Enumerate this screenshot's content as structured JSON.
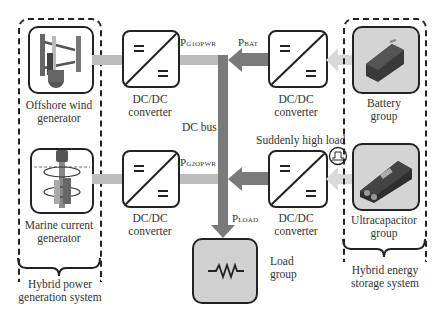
{
  "diagram": {
    "left_group": {
      "title": "Hybrid power generation system",
      "title_line1": "Hybrid power",
      "title_line2": "generation system",
      "items": [
        {
          "id": "wind",
          "label_line1": "Offshore wind",
          "label_line2": "generator",
          "icon": "vertical-axis-wind-turbine-icon"
        },
        {
          "id": "marine",
          "label_line1": "Marine current",
          "label_line2": "generator",
          "icon": "marine-current-turbine-icon"
        }
      ]
    },
    "right_group": {
      "title": "Hybrid energy storage system",
      "title_line1": "Hybrid energy",
      "title_line2": "storage system",
      "items": [
        {
          "id": "battery",
          "label_line1": "Battery",
          "label_line2": "group",
          "icon": "battery-pack-icon"
        },
        {
          "id": "ultracap",
          "label_line1": "Ultracapacitor",
          "label_line2": "group",
          "icon": "ultracapacitor-module-icon"
        }
      ]
    },
    "converters": [
      {
        "id": "conv-g1",
        "label_line1": "DC/DC",
        "label_line2": "converter"
      },
      {
        "id": "conv-g2",
        "label_line1": "DC/DC",
        "label_line2": "converter"
      },
      {
        "id": "conv-bat",
        "label_line1": "DC/DC",
        "label_line2": "converter"
      },
      {
        "id": "conv-uc",
        "label_line1": "DC/DC",
        "label_line2": "converter"
      }
    ],
    "converter_symbol": "=",
    "bus": {
      "label": "DC bus"
    },
    "flows": {
      "g1": {
        "base": "P",
        "sub": "G1OPWR"
      },
      "g2": {
        "base": "P",
        "sub": "G2OPWR"
      },
      "bat": {
        "base": "P",
        "sub": "BAT"
      },
      "load": {
        "base": "P",
        "sub": "LOAD"
      }
    },
    "load": {
      "label_line1": "Load",
      "label_line2": "group",
      "icon": "resistor-icon"
    },
    "event": {
      "label": "Suddenly high load",
      "icon": "load-step-pulse-icon"
    },
    "colors": {
      "bus": "#7a7a7a",
      "generation_flow": "#bdbdbd",
      "storage_flow_in": "#d9d9d9",
      "storage_flow_out": "#7a7a7a",
      "load_box": "#d0d0d0",
      "outline": "#222222"
    }
  }
}
